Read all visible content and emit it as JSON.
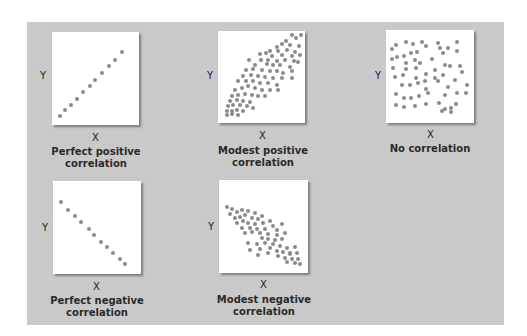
{
  "figure": {
    "panel_color": "#c9c9c9",
    "dot_color": "#8a8a8a",
    "plots": [
      {
        "id": "perfect-positive",
        "x_label": "X",
        "y_label": "Y",
        "caption_line1": "Perfect positive",
        "caption_line2": "correlation",
        "box": {
          "left": 52,
          "top": 32,
          "width": 87,
          "height": 93
        },
        "dots": [
          [
            8,
            84
          ],
          [
            13,
            78
          ],
          [
            19,
            73
          ],
          [
            25,
            67
          ],
          [
            31,
            60
          ],
          [
            38,
            54
          ],
          [
            43,
            48
          ],
          [
            50,
            41
          ],
          [
            57,
            34
          ],
          [
            63,
            28
          ],
          [
            70,
            20
          ]
        ]
      },
      {
        "id": "modest-positive",
        "x_label": "X",
        "y_label": "Y",
        "caption_line1": "Modest positive",
        "caption_line2": "correlation",
        "box": {
          "left": 218,
          "top": 31,
          "width": 87,
          "height": 92
        },
        "dots": [
          [
            74,
            4
          ],
          [
            83,
            4
          ],
          [
            68,
            10
          ],
          [
            78,
            7
          ],
          [
            64,
            13
          ],
          [
            72,
            14
          ],
          [
            81,
            15
          ],
          [
            59,
            16
          ],
          [
            52,
            20
          ],
          [
            48,
            22
          ],
          [
            60,
            20
          ],
          [
            69,
            19
          ],
          [
            77,
            21
          ],
          [
            42,
            23
          ],
          [
            54,
            25
          ],
          [
            64,
            24
          ],
          [
            74,
            25
          ],
          [
            82,
            24
          ],
          [
            31,
            29
          ],
          [
            43,
            29
          ],
          [
            50,
            29
          ],
          [
            59,
            30
          ],
          [
            67,
            29
          ],
          [
            76,
            30
          ],
          [
            80,
            31
          ],
          [
            37,
            34
          ],
          [
            49,
            33
          ],
          [
            55,
            34
          ],
          [
            62,
            34
          ],
          [
            72,
            36
          ],
          [
            28,
            39
          ],
          [
            35,
            38
          ],
          [
            44,
            39
          ],
          [
            52,
            40
          ],
          [
            59,
            40
          ],
          [
            65,
            42
          ],
          [
            74,
            40
          ],
          [
            25,
            45
          ],
          [
            33,
            44
          ],
          [
            40,
            45
          ],
          [
            47,
            46
          ],
          [
            55,
            47
          ],
          [
            64,
            47
          ],
          [
            74,
            47
          ],
          [
            20,
            50
          ],
          [
            28,
            50
          ],
          [
            35,
            50
          ],
          [
            42,
            52
          ],
          [
            50,
            52
          ],
          [
            59,
            54
          ],
          [
            17,
            59
          ],
          [
            24,
            57
          ],
          [
            30,
            55
          ],
          [
            37,
            57
          ],
          [
            44,
            59
          ],
          [
            52,
            59
          ],
          [
            60,
            59
          ],
          [
            14,
            65
          ],
          [
            20,
            64
          ],
          [
            27,
            63
          ],
          [
            34,
            64
          ],
          [
            40,
            65
          ],
          [
            47,
            65
          ],
          [
            12,
            70
          ],
          [
            19,
            69
          ],
          [
            25,
            70
          ],
          [
            32,
            71
          ],
          [
            10,
            75
          ],
          [
            15,
            74
          ],
          [
            22,
            74
          ],
          [
            29,
            75
          ],
          [
            35,
            77
          ],
          [
            9,
            80
          ],
          [
            14,
            80
          ],
          [
            19,
            79
          ],
          [
            25,
            80
          ],
          [
            9,
            84
          ],
          [
            14,
            83
          ],
          [
            20,
            84
          ]
        ]
      },
      {
        "id": "no-correlation",
        "x_label": "X",
        "y_label": "Y",
        "caption_line1": "No correlation",
        "caption_line2": "",
        "box": {
          "left": 386,
          "top": 30,
          "width": 88,
          "height": 93
        },
        "dots": [
          [
            6,
            19
          ],
          [
            10,
            15
          ],
          [
            20,
            12
          ],
          [
            27,
            14
          ],
          [
            36,
            12
          ],
          [
            40,
            16
          ],
          [
            52,
            13
          ],
          [
            54,
            18
          ],
          [
            62,
            18
          ],
          [
            71,
            12
          ],
          [
            6,
            29
          ],
          [
            11,
            27
          ],
          [
            18,
            26
          ],
          [
            25,
            23
          ],
          [
            31,
            22
          ],
          [
            57,
            23
          ],
          [
            71,
            21
          ],
          [
            7,
            38
          ],
          [
            20,
            33
          ],
          [
            29,
            30
          ],
          [
            34,
            33
          ],
          [
            46,
            29
          ],
          [
            30,
            38
          ],
          [
            20,
            39
          ],
          [
            59,
            35
          ],
          [
            64,
            36
          ],
          [
            74,
            36
          ],
          [
            9,
            47
          ],
          [
            17,
            45
          ],
          [
            30,
            48
          ],
          [
            32,
            53
          ],
          [
            40,
            44
          ],
          [
            49,
            40
          ],
          [
            49,
            48
          ],
          [
            57,
            45
          ],
          [
            76,
            42
          ],
          [
            16,
            55
          ],
          [
            24,
            55
          ],
          [
            39,
            51
          ],
          [
            40,
            59
          ],
          [
            52,
            51
          ],
          [
            69,
            50
          ],
          [
            81,
            55
          ],
          [
            10,
            64
          ],
          [
            18,
            68
          ],
          [
            25,
            68
          ],
          [
            33,
            66
          ],
          [
            42,
            63
          ],
          [
            59,
            65
          ],
          [
            62,
            57
          ],
          [
            71,
            63
          ],
          [
            80,
            63
          ],
          [
            10,
            75
          ],
          [
            18,
            77
          ],
          [
            29,
            76
          ],
          [
            40,
            74
          ],
          [
            53,
            73
          ],
          [
            59,
            79
          ],
          [
            65,
            78
          ],
          [
            70,
            74
          ],
          [
            56,
            81
          ],
          [
            65,
            82
          ]
        ]
      },
      {
        "id": "perfect-negative",
        "x_label": "X",
        "y_label": "Y",
        "caption_line1": "Perfect negative",
        "caption_line2": "correlation",
        "box": {
          "left": 53,
          "top": 181,
          "width": 88,
          "height": 93
        },
        "dots": [
          [
            8,
            21
          ],
          [
            15,
            29
          ],
          [
            22,
            35
          ],
          [
            28,
            41
          ],
          [
            36,
            48
          ],
          [
            41,
            54
          ],
          [
            48,
            61
          ],
          [
            54,
            66
          ],
          [
            60,
            72
          ],
          [
            67,
            78
          ],
          [
            72,
            83
          ]
        ]
      },
      {
        "id": "modest-negative",
        "x_label": "X",
        "y_label": "Y",
        "caption_line1": "Modest negative",
        "caption_line2": "correlation",
        "box": {
          "left": 219,
          "top": 180,
          "width": 89,
          "height": 93
        },
        "dots": [
          [
            8,
            27
          ],
          [
            13,
            29
          ],
          [
            11,
            34
          ],
          [
            18,
            32
          ],
          [
            23,
            30
          ],
          [
            29,
            31
          ],
          [
            36,
            33
          ],
          [
            43,
            36
          ],
          [
            16,
            38
          ],
          [
            21,
            37
          ],
          [
            26,
            35
          ],
          [
            33,
            38
          ],
          [
            39,
            39
          ],
          [
            51,
            41
          ],
          [
            18,
            43
          ],
          [
            24,
            41
          ],
          [
            29,
            43
          ],
          [
            36,
            44
          ],
          [
            44,
            43
          ],
          [
            54,
            46
          ],
          [
            63,
            44
          ],
          [
            23,
            48
          ],
          [
            31,
            48
          ],
          [
            38,
            49
          ],
          [
            46,
            49
          ],
          [
            58,
            50
          ],
          [
            26,
            53
          ],
          [
            33,
            52
          ],
          [
            41,
            53
          ],
          [
            49,
            54
          ],
          [
            58,
            55
          ],
          [
            66,
            53
          ],
          [
            43,
            58
          ],
          [
            49,
            59
          ],
          [
            56,
            60
          ],
          [
            63,
            59
          ],
          [
            29,
            63
          ],
          [
            38,
            64
          ],
          [
            46,
            63
          ],
          [
            54,
            64
          ],
          [
            61,
            66
          ],
          [
            68,
            68
          ],
          [
            76,
            67
          ],
          [
            31,
            70
          ],
          [
            41,
            69
          ],
          [
            51,
            68
          ],
          [
            58,
            71
          ],
          [
            64,
            72
          ],
          [
            71,
            73
          ],
          [
            78,
            73
          ],
          [
            39,
            75
          ],
          [
            49,
            73
          ],
          [
            59,
            76
          ],
          [
            66,
            78
          ],
          [
            73,
            79
          ],
          [
            79,
            79
          ],
          [
            68,
            82
          ],
          [
            76,
            83
          ],
          [
            81,
            84
          ],
          [
            71,
            74
          ]
        ]
      }
    ]
  },
  "chart_data": [
    {
      "type": "scatter",
      "title": "Perfect positive correlation",
      "xlabel": "X",
      "ylabel": "Y",
      "trend": "perfect positive",
      "points": 11
    },
    {
      "type": "scatter",
      "title": "Modest positive correlation",
      "xlabel": "X",
      "ylabel": "Y",
      "trend": "modest positive",
      "points": 80
    },
    {
      "type": "scatter",
      "title": "No correlation",
      "xlabel": "X",
      "ylabel": "Y",
      "trend": "none",
      "points": 62
    },
    {
      "type": "scatter",
      "title": "Perfect negative correlation",
      "xlabel": "X",
      "ylabel": "Y",
      "trend": "perfect negative",
      "points": 11
    },
    {
      "type": "scatter",
      "title": "Modest negative correlation",
      "xlabel": "X",
      "ylabel": "Y",
      "trend": "modest negative",
      "points": 60
    }
  ]
}
